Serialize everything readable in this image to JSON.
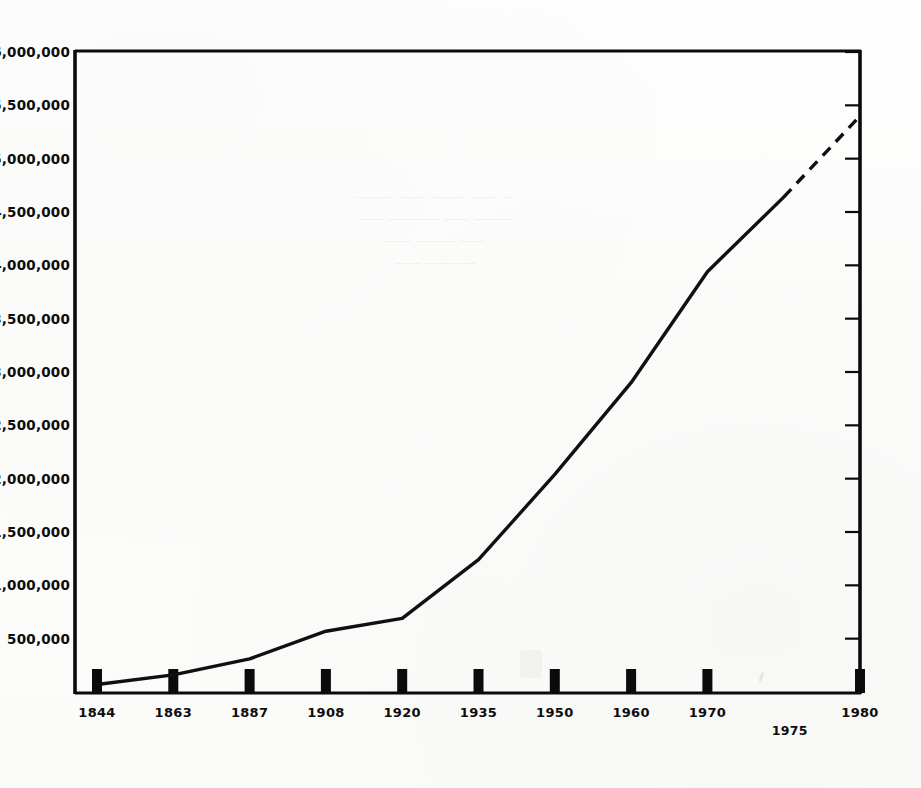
{
  "chart_data": {
    "type": "line",
    "title": "",
    "subtitle": "",
    "xlabel": "",
    "ylabel": "",
    "categories": [
      "1844",
      "1863",
      "1887",
      "1908",
      "1920",
      "1935",
      "1950",
      "1960",
      "1970",
      "1975",
      "1980"
    ],
    "x_tick_labels": [
      "1844",
      "1863",
      "1887",
      "1908",
      "1920",
      "1935",
      "1950",
      "1960",
      "1970",
      "1980"
    ],
    "x_offset_label": "1975",
    "values": [
      70000,
      160000,
      310000,
      570000,
      690000,
      1240000,
      2040000,
      2900000,
      3940000,
      4640000,
      5400000
    ],
    "series": [
      {
        "name": "population",
        "values": [
          70000,
          160000,
          310000,
          570000,
          690000,
          1240000,
          2040000,
          2900000,
          3940000,
          4640000,
          5400000
        ],
        "solid_through_index": 9,
        "projection_style": "dashed"
      }
    ],
    "y_tick_labels": [
      "6,000,000",
      "5,500,000",
      "5,000,000",
      "4,500,000",
      "4,000,000",
      "3,500,000",
      "3,000,000",
      "2,500,000",
      "2,000,000",
      "1,500,000",
      "1,000,000",
      "500,000"
    ],
    "y_tick_values": [
      6000000,
      5500000,
      5000000,
      4500000,
      4000000,
      3500000,
      3000000,
      2500000,
      2000000,
      1500000,
      1000000,
      500000
    ],
    "ylim": [
      0,
      6000000
    ],
    "y_tick_step": 500000,
    "grid": false,
    "legend": false,
    "legend_position": "none",
    "line_color": "#101010",
    "axis_color": "#0b0b0b",
    "background_color": "#fdfdfc",
    "annotations": []
  },
  "figure": {
    "frame_style": "open-box (left axis, right axis, top rule, bottom rule)",
    "x_tick_style": "solid black rectangles on baseline",
    "right_axis_tick_style": "inward short ticks at each 500,000"
  },
  "bleed_through": {
    "line1": "— —— ——— —— ———",
    "line2": "——— —— ———— ——",
    "line3": "—— ——— ——",
    "line4": "———— ——"
  }
}
